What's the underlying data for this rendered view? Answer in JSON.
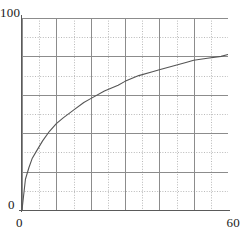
{
  "chart_data": {
    "type": "line",
    "title": "",
    "subtitle": "",
    "xlabel": "",
    "ylabel": "",
    "xlim": [
      0,
      60
    ],
    "ylim": [
      0,
      100
    ],
    "grid": true,
    "legend": false,
    "legend_position": "none",
    "x_tick_labels": [
      "0",
      "60"
    ],
    "y_tick_labels": [
      "0",
      "100"
    ],
    "x_major_ticks": [
      0,
      10,
      20,
      30,
      40,
      50,
      60
    ],
    "y_major_ticks": [
      0,
      20,
      40,
      60,
      80,
      100
    ],
    "x_minor_ticks": [
      5,
      15,
      25,
      35,
      45,
      55
    ],
    "y_minor_ticks": [
      10,
      30,
      50,
      70,
      90
    ],
    "series": [
      {
        "name": "curve",
        "color": "#555555",
        "x": [
          0,
          1,
          2,
          3,
          4,
          5,
          6,
          8,
          10,
          12,
          15,
          18,
          20,
          24,
          28,
          30,
          34,
          38,
          40,
          44,
          48,
          50,
          54,
          58,
          60
        ],
        "y": [
          0,
          16,
          22,
          27,
          30,
          33,
          36,
          41,
          45,
          48,
          52,
          56,
          58,
          62,
          65,
          67,
          70,
          72,
          73,
          75,
          77,
          78,
          79,
          80,
          81
        ]
      }
    ]
  },
  "labels": {
    "y_max": "100",
    "y_min": "0",
    "x_min": "0",
    "x_max": "60"
  },
  "colors": {
    "curve": "#555555",
    "axis": "#5a5a5a",
    "grid_major": "#8c8c8c",
    "grid_minor": "#b9b9b9",
    "background": "#ffffff",
    "text": "#1a1a1a"
  }
}
